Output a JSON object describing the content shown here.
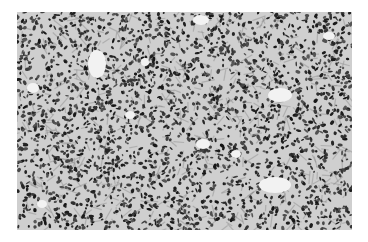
{
  "image": {
    "kind": "grayscale histology micrograph",
    "subject": "densely packed dark-staining cells with scattered pale gland-like spaces",
    "colors": {
      "background": "#ffffff",
      "tissue_base": "#cfcfcf",
      "nuclei": "#2a2a2a",
      "stroma": "#8a8a8a",
      "lumen": "#f2f2f2"
    },
    "lumens": [
      {
        "x": 80,
        "y": 52,
        "rx": 9,
        "ry": 14
      },
      {
        "x": 16,
        "y": 76,
        "rx": 6,
        "ry": 5
      },
      {
        "x": 184,
        "y": 8,
        "rx": 8,
        "ry": 5
      },
      {
        "x": 263,
        "y": 83,
        "rx": 12,
        "ry": 7
      },
      {
        "x": 186,
        "y": 132,
        "rx": 7,
        "ry": 5
      },
      {
        "x": 258,
        "y": 173,
        "rx": 16,
        "ry": 8
      },
      {
        "x": 219,
        "y": 142,
        "rx": 5,
        "ry": 4
      },
      {
        "x": 113,
        "y": 103,
        "rx": 5,
        "ry": 4
      },
      {
        "x": 25,
        "y": 192,
        "rx": 5,
        "ry": 4
      },
      {
        "x": 312,
        "y": 24,
        "rx": 6,
        "ry": 4
      },
      {
        "x": 128,
        "y": 50,
        "rx": 4,
        "ry": 4
      }
    ]
  }
}
